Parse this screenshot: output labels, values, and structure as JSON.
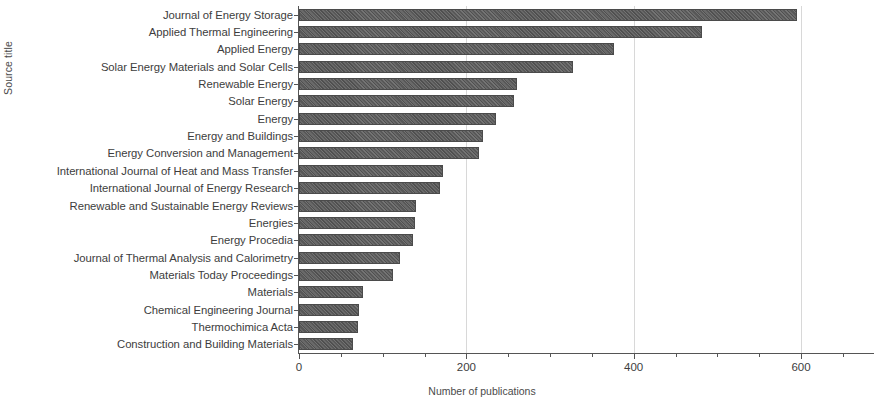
{
  "chart_data": {
    "type": "bar",
    "orientation": "horizontal",
    "title": "",
    "xlabel": "Number of publications",
    "ylabel": "Source title",
    "xlim": [
      0,
      680
    ],
    "ylim": null,
    "grid": "vertical-major-only",
    "legend": null,
    "xticks": [
      0,
      200,
      400,
      600
    ],
    "xtick_labels": [
      "0",
      "200",
      "400",
      "600"
    ],
    "xminor_step": 50,
    "bar_color": "#585858",
    "bar_pattern": "diagonal-hatch",
    "categories": [
      "Journal of Energy Storage",
      "Applied Thermal Engineering",
      "Applied Energy",
      "Solar Energy Materials and Solar Cells",
      "Renewable Energy",
      "Solar Energy",
      "Energy",
      "Energy and Buildings",
      "Energy Conversion and Management",
      "International Journal of Heat and Mass Transfer",
      "International Journal of Energy Research",
      "Renewable and Sustainable Energy Reviews",
      "Energies",
      "Energy Procedia",
      "Journal of Thermal Analysis and Calorimetry",
      "Materials Today Proceedings",
      "Materials",
      "Chemical Engineering Journal",
      "Thermochimica Acta",
      "Construction and Building Materials"
    ],
    "values": [
      595,
      482,
      376,
      327,
      260,
      257,
      235,
      220,
      215,
      172,
      169,
      140,
      139,
      136,
      121,
      112,
      76,
      72,
      70,
      64
    ]
  }
}
